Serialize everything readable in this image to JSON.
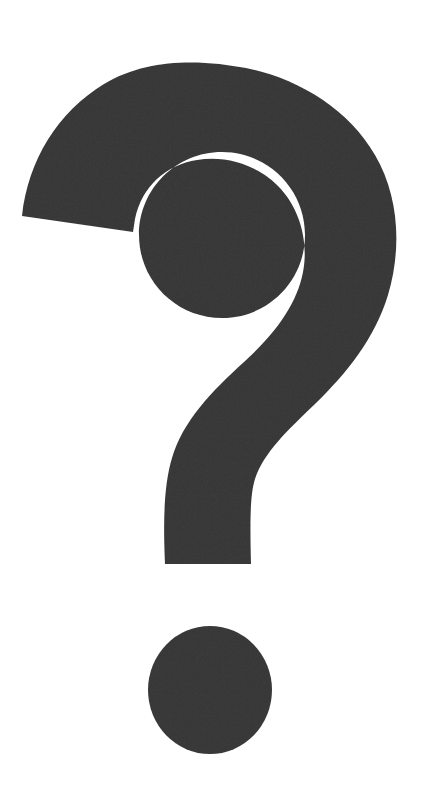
{
  "image": {
    "kind": "scanned-symbol-image",
    "width": 434,
    "height": 786,
    "background_color": "#ffffff",
    "alt_text": "Question mark"
  },
  "symbol": {
    "name": "question-mark",
    "character": "?",
    "fill_color": "#3b3b3b",
    "texture": "paper-grain-noise",
    "parts": [
      {
        "name": "hook",
        "label": "bowl",
        "description": "Large open arc forming the upper curve of the question mark",
        "outer_arc_top_y": 68,
        "left_terminal_x": 22,
        "right_extent_x": 398
      },
      {
        "name": "counter",
        "label": "counter",
        "description": "White enclosed hole inside the hook",
        "center_x": 222,
        "center_y": 235,
        "radius": 83,
        "color": "#ffffff"
      },
      {
        "name": "stem",
        "label": "stem",
        "description": "Tapering vertical descender with flat foot",
        "foot_y": 564,
        "foot_left_x": 165,
        "foot_right_x": 252
      },
      {
        "name": "dot",
        "label": "dot",
        "description": "Round tittle below the stem",
        "center_x": 210,
        "center_y": 690,
        "radius_x": 62,
        "radius_y": 64,
        "color": "#3b3b3b"
      }
    ]
  }
}
